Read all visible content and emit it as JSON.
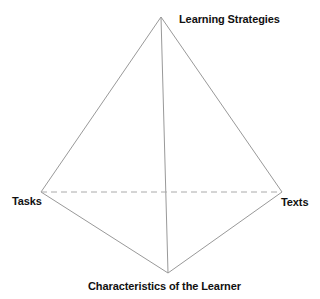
{
  "diagram": {
    "type": "tetrahedron",
    "line_color": "#999999",
    "dashed_color": "#aaaaaa",
    "vertices": {
      "top": {
        "label": "Learning Strategies",
        "x": 161,
        "y": 17
      },
      "left": {
        "label": "Tasks",
        "x": 41,
        "y": 192
      },
      "right": {
        "label": "Texts",
        "x": 282,
        "y": 192
      },
      "bottom": {
        "label": "Characteristics of the Learner",
        "x": 168,
        "y": 273
      }
    },
    "edges": [
      {
        "from": "top",
        "to": "left",
        "style": "solid"
      },
      {
        "from": "top",
        "to": "right",
        "style": "solid"
      },
      {
        "from": "top",
        "to": "bottom",
        "style": "solid"
      },
      {
        "from": "left",
        "to": "bottom",
        "style": "solid"
      },
      {
        "from": "right",
        "to": "bottom",
        "style": "solid"
      },
      {
        "from": "left",
        "to": "right",
        "style": "dashed"
      }
    ]
  }
}
